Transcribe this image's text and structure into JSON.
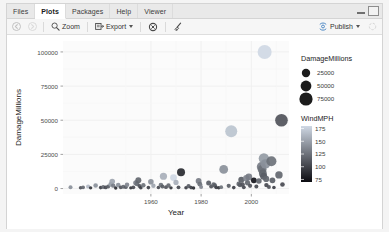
{
  "window": {
    "tabs": [
      {
        "label": "Files",
        "active": false
      },
      {
        "label": "Plots",
        "active": true
      },
      {
        "label": "Packages",
        "active": false
      },
      {
        "label": "Help",
        "active": false
      },
      {
        "label": "Viewer",
        "active": false
      }
    ],
    "controls": {
      "minimize": "minimize",
      "maximize": "maximize"
    }
  },
  "toolbar": {
    "back_label": "◀",
    "forward_label": "▶",
    "zoom_label": "Zoom",
    "export_label": "Export",
    "remove_label": "remove-plot",
    "clear_label": "clear-all-plots",
    "publish_label": "Publish"
  },
  "chart_data": {
    "type": "scatter",
    "title": "",
    "xlabel": "Year",
    "ylabel": "DamageMillions",
    "xlim": [
      1925,
      2015
    ],
    "ylim": [
      -4000,
      108000
    ],
    "xticks": [
      1960,
      1980,
      2000
    ],
    "yticks": [
      0,
      25000,
      50000,
      75000,
      100000
    ],
    "ytick_labels": [
      "0",
      "25000",
      "50000",
      "75000",
      "100000"
    ],
    "xtick_labels": [
      "1960",
      "1980",
      "2000"
    ],
    "grid": true,
    "panel_background": "#fbfbfb",
    "grid_color": "#f0f0f0",
    "legends": [
      {
        "name": "size",
        "title": "DamageMillions",
        "type": "size",
        "position": "right",
        "entries": [
          {
            "label": "25000",
            "size": 4.2
          },
          {
            "label": "50000",
            "size": 5.4
          },
          {
            "label": "75000",
            "size": 6.6
          }
        ]
      },
      {
        "name": "color",
        "title": "WindMPH",
        "type": "colorbar",
        "position": "right",
        "ticks": [
          175,
          150,
          125,
          100,
          75
        ],
        "tick_labels": [
          "175",
          "150",
          "125",
          "100",
          "75"
        ],
        "gradient_high": "#cfd8e4",
        "gradient_low": "#0b0b10"
      }
    ],
    "points": [
      {
        "x": 1928,
        "y": 1000,
        "size": 2.0,
        "wind": 140
      },
      {
        "x": 1932,
        "y": 600,
        "size": 1.8,
        "wind": 110
      },
      {
        "x": 1933,
        "y": 900,
        "size": 1.9,
        "wind": 120
      },
      {
        "x": 1935,
        "y": 1500,
        "size": 2.1,
        "wind": 160
      },
      {
        "x": 1936,
        "y": 500,
        "size": 1.7,
        "wind": 95
      },
      {
        "x": 1938,
        "y": 2200,
        "size": 2.3,
        "wind": 140
      },
      {
        "x": 1940,
        "y": 700,
        "size": 1.8,
        "wind": 100
      },
      {
        "x": 1941,
        "y": 1200,
        "size": 2.0,
        "wind": 120
      },
      {
        "x": 1942,
        "y": 800,
        "size": 1.9,
        "wind": 105
      },
      {
        "x": 1943,
        "y": 1400,
        "size": 2.0,
        "wind": 115
      },
      {
        "x": 1944,
        "y": 3000,
        "size": 2.4,
        "wind": 145
      },
      {
        "x": 1944.6,
        "y": 5200,
        "size": 2.8,
        "wind": 150
      },
      {
        "x": 1945,
        "y": 2100,
        "size": 2.2,
        "wind": 130
      },
      {
        "x": 1946,
        "y": 400,
        "size": 1.7,
        "wind": 90
      },
      {
        "x": 1947,
        "y": 2600,
        "size": 2.3,
        "wind": 140
      },
      {
        "x": 1948,
        "y": 900,
        "size": 1.9,
        "wind": 110
      },
      {
        "x": 1949,
        "y": 1300,
        "size": 2.0,
        "wind": 120
      },
      {
        "x": 1950,
        "y": 1000,
        "size": 1.9,
        "wind": 115
      },
      {
        "x": 1950.5,
        "y": 2800,
        "size": 2.3,
        "wind": 135
      },
      {
        "x": 1952,
        "y": 500,
        "size": 1.7,
        "wind": 95
      },
      {
        "x": 1953,
        "y": 900,
        "size": 1.9,
        "wind": 105
      },
      {
        "x": 1954,
        "y": 4200,
        "size": 2.6,
        "wind": 130
      },
      {
        "x": 1954.5,
        "y": 3400,
        "size": 2.4,
        "wind": 125
      },
      {
        "x": 1955,
        "y": 6000,
        "size": 3.0,
        "wind": 120
      },
      {
        "x": 1955.5,
        "y": 1800,
        "size": 2.1,
        "wind": 110
      },
      {
        "x": 1956,
        "y": 600,
        "size": 1.8,
        "wind": 100
      },
      {
        "x": 1957,
        "y": 2400,
        "size": 2.2,
        "wind": 125
      },
      {
        "x": 1959,
        "y": 700,
        "size": 1.8,
        "wind": 100
      },
      {
        "x": 1960,
        "y": 5000,
        "size": 2.8,
        "wind": 140
      },
      {
        "x": 1961,
        "y": 2000,
        "size": 2.2,
        "wind": 150
      },
      {
        "x": 1963,
        "y": 800,
        "size": 1.8,
        "wind": 105
      },
      {
        "x": 1964,
        "y": 2600,
        "size": 2.3,
        "wind": 125
      },
      {
        "x": 1964.6,
        "y": 1500,
        "size": 2.0,
        "wind": 115
      },
      {
        "x": 1965,
        "y": 9000,
        "size": 3.6,
        "wind": 155
      },
      {
        "x": 1966,
        "y": 1000,
        "size": 1.9,
        "wind": 110
      },
      {
        "x": 1967,
        "y": 2200,
        "size": 2.2,
        "wind": 120
      },
      {
        "x": 1968,
        "y": 500,
        "size": 1.7,
        "wind": 95
      },
      {
        "x": 1969,
        "y": 8000,
        "size": 3.4,
        "wind": 175
      },
      {
        "x": 1970,
        "y": 4500,
        "size": 2.6,
        "wind": 155
      },
      {
        "x": 1971,
        "y": 900,
        "size": 1.9,
        "wind": 105
      },
      {
        "x": 1972,
        "y": 12000,
        "size": 4.0,
        "wind": 90
      },
      {
        "x": 1974,
        "y": 600,
        "size": 1.8,
        "wind": 100
      },
      {
        "x": 1975,
        "y": 1800,
        "size": 2.1,
        "wind": 115
      },
      {
        "x": 1976,
        "y": 700,
        "size": 1.8,
        "wind": 100
      },
      {
        "x": 1977,
        "y": 400,
        "size": 1.7,
        "wind": 90
      },
      {
        "x": 1979,
        "y": 5500,
        "size": 2.9,
        "wind": 130
      },
      {
        "x": 1979.5,
        "y": 3200,
        "size": 2.4,
        "wind": 125
      },
      {
        "x": 1980,
        "y": 1200,
        "size": 2.0,
        "wind": 135
      },
      {
        "x": 1983,
        "y": 4000,
        "size": 2.5,
        "wind": 115
      },
      {
        "x": 1984,
        "y": 1500,
        "size": 2.0,
        "wind": 110
      },
      {
        "x": 1985,
        "y": 3000,
        "size": 2.3,
        "wind": 120
      },
      {
        "x": 1985.5,
        "y": 2200,
        "size": 2.2,
        "wind": 115
      },
      {
        "x": 1986,
        "y": 800,
        "size": 1.8,
        "wind": 100
      },
      {
        "x": 1987,
        "y": 600,
        "size": 1.8,
        "wind": 95
      },
      {
        "x": 1988,
        "y": 1000,
        "size": 1.9,
        "wind": 125
      },
      {
        "x": 1989,
        "y": 14000,
        "size": 4.4,
        "wind": 140
      },
      {
        "x": 1991,
        "y": 2000,
        "size": 2.1,
        "wind": 115
      },
      {
        "x": 1992,
        "y": 42000,
        "size": 6.0,
        "wind": 165
      },
      {
        "x": 1993,
        "y": 700,
        "size": 1.8,
        "wind": 100
      },
      {
        "x": 1995,
        "y": 3400,
        "size": 2.4,
        "wind": 120
      },
      {
        "x": 1995.5,
        "y": 2600,
        "size": 2.3,
        "wind": 115
      },
      {
        "x": 1996,
        "y": 6500,
        "size": 3.0,
        "wind": 115
      },
      {
        "x": 1996.5,
        "y": 3000,
        "size": 2.3,
        "wind": 110
      },
      {
        "x": 1997,
        "y": 900,
        "size": 1.9,
        "wind": 105
      },
      {
        "x": 1998,
        "y": 7500,
        "size": 3.2,
        "wind": 135
      },
      {
        "x": 1998.5,
        "y": 4200,
        "size": 2.6,
        "wind": 120
      },
      {
        "x": 1999,
        "y": 8500,
        "size": 3.4,
        "wind": 130
      },
      {
        "x": 1999.5,
        "y": 2000,
        "size": 2.1,
        "wind": 110
      },
      {
        "x": 2001,
        "y": 6000,
        "size": 2.9,
        "wind": 80
      },
      {
        "x": 2002,
        "y": 1500,
        "size": 2.0,
        "wind": 105
      },
      {
        "x": 2003,
        "y": 5500,
        "size": 2.8,
        "wind": 120
      },
      {
        "x": 2004,
        "y": 16000,
        "size": 4.6,
        "wind": 130
      },
      {
        "x": 2004.3,
        "y": 14000,
        "size": 4.4,
        "wind": 125
      },
      {
        "x": 2004.6,
        "y": 11000,
        "size": 3.9,
        "wind": 120
      },
      {
        "x": 2004.9,
        "y": 9000,
        "size": 3.5,
        "wind": 115
      },
      {
        "x": 2005,
        "y": 22000,
        "size": 5.2,
        "wind": 145
      },
      {
        "x": 2005.3,
        "y": 100000,
        "size": 7.0,
        "wind": 175
      },
      {
        "x": 2005.6,
        "y": 18000,
        "size": 4.8,
        "wind": 140
      },
      {
        "x": 2005.9,
        "y": 7000,
        "size": 3.1,
        "wind": 120
      },
      {
        "x": 2006,
        "y": 2500,
        "size": 2.2,
        "wind": 105
      },
      {
        "x": 2007,
        "y": 1200,
        "size": 2.0,
        "wind": 110
      },
      {
        "x": 2008,
        "y": 20000,
        "size": 5.0,
        "wind": 125
      },
      {
        "x": 2008.4,
        "y": 6000,
        "size": 2.9,
        "wind": 115
      },
      {
        "x": 2009,
        "y": 800,
        "size": 1.8,
        "wind": 100
      },
      {
        "x": 2011,
        "y": 10000,
        "size": 3.7,
        "wind": 120
      },
      {
        "x": 2012,
        "y": 50000,
        "size": 6.3,
        "wind": 110
      },
      {
        "x": 2012.4,
        "y": 3000,
        "size": 2.3,
        "wind": 105
      }
    ]
  }
}
